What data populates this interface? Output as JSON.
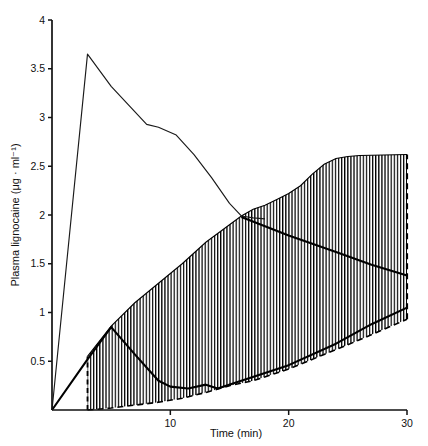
{
  "chart_data": {
    "type": "line",
    "title": "",
    "xlabel": "Time (min)",
    "ylabel": "Plasma lignocaine (μg · ml⁻¹)",
    "xlim": [
      0,
      30
    ],
    "ylim": [
      0,
      4
    ],
    "xticks": [
      10,
      20,
      30
    ],
    "xticklabels": [
      "10",
      "20",
      "30"
    ],
    "yticks": [
      0.5,
      1,
      1.5,
      2,
      2.5,
      3,
      3.5,
      4
    ],
    "yticklabels": [
      "0.5",
      "1",
      "1.5",
      "2",
      "2.5",
      "3",
      "3.5",
      "4"
    ],
    "grid": false,
    "legend": null,
    "series": [
      {
        "name": "peak-concentration-curve",
        "style": "thin-solid-line",
        "color": "#1a1a1a",
        "x": [
          0,
          3,
          5,
          8,
          9,
          10.5,
          12,
          13.5,
          15,
          16,
          17,
          18
        ],
        "values": [
          0.0,
          3.65,
          3.32,
          2.93,
          2.9,
          2.82,
          2.62,
          2.38,
          2.12,
          1.99,
          1.97,
          1.96
        ]
      },
      {
        "name": "declining-thick-curve",
        "style": "thick-solid-line",
        "color": "#000000",
        "x": [
          16,
          20,
          24,
          27,
          30
        ],
        "values": [
          1.98,
          1.79,
          1.62,
          1.49,
          1.38
        ]
      },
      {
        "name": "lower-thick-curve",
        "style": "thick-solid-line",
        "color": "#000000",
        "x": [
          0,
          3,
          5,
          7,
          9,
          10,
          11.5,
          13,
          14,
          16,
          20,
          24,
          27,
          30
        ],
        "values": [
          0.0,
          0.52,
          0.85,
          0.57,
          0.3,
          0.24,
          0.22,
          0.26,
          0.22,
          0.3,
          0.46,
          0.68,
          0.88,
          1.05
        ]
      },
      {
        "name": "band-upper-boundary",
        "style": "hatch-band-edge",
        "color": "#000000",
        "x": [
          3,
          5,
          7,
          9,
          11,
          13,
          15,
          16,
          17,
          18,
          19,
          20,
          21,
          22,
          23,
          24,
          25,
          26,
          30
        ],
        "values": [
          0.55,
          0.86,
          1.1,
          1.3,
          1.5,
          1.72,
          1.9,
          1.99,
          2.06,
          2.1,
          2.16,
          2.22,
          2.3,
          2.42,
          2.52,
          2.58,
          2.6,
          2.61,
          2.62
        ]
      },
      {
        "name": "band-lower-boundary",
        "style": "hatch-band-edge-dashed",
        "color": "#000000",
        "x": [
          3,
          5,
          7,
          9,
          11,
          13,
          15,
          17,
          20,
          23,
          26,
          30
        ],
        "values": [
          0.0,
          0.02,
          0.05,
          0.08,
          0.12,
          0.18,
          0.25,
          0.3,
          0.42,
          0.57,
          0.72,
          0.93
        ]
      }
    ],
    "annotations": [
      {
        "name": "left-dashed-marker",
        "x": 3,
        "y_from": 0.0,
        "y_to": 0.55,
        "style": "dashed-vertical"
      },
      {
        "name": "right-dashed-marker",
        "x": 30,
        "y_from": 0.93,
        "y_to": 2.62,
        "style": "dashed-vertical"
      }
    ],
    "shaded_region": {
      "name": "vertical-hatched-band",
      "hatch": "vertical-lines",
      "color": "#000000",
      "description": "Vertically hatched region between band-lower-boundary and band-upper-boundary from t=3 to t=30"
    }
  }
}
